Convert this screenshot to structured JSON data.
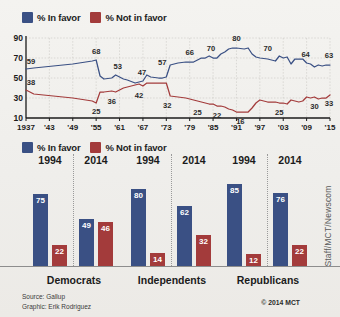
{
  "colors": {
    "in_favor": "#3a5084",
    "not_in_favor": "#a33b3b",
    "background": "#f2f1ee",
    "axis": "#1b1b1b",
    "grid": "#c9c7c2"
  },
  "clipped_title": "",
  "legend": {
    "in_favor_label": "% In favor",
    "not_in_favor_label": "% Not in favor"
  },
  "source": {
    "line1": "Source: Gallup",
    "line2": "Graphic: Erik Rodriguez"
  },
  "copyright": "© 2014 MCT",
  "credit": "Staff/MCT/Newscom",
  "chart_data": [
    {
      "type": "line",
      "title": "",
      "xlabel": "",
      "ylabel": "",
      "ylim": [
        10,
        90
      ],
      "yticks": [
        90,
        70,
        50,
        30,
        10
      ],
      "xticks": [
        "1937",
        "'43",
        "'49",
        "'55",
        "'61",
        "'67",
        "'73",
        "'79",
        "'85",
        "'91",
        "'97",
        "'03",
        "'09",
        "'15"
      ],
      "grid": true,
      "legend_position": "top-left",
      "series": [
        {
          "name": "% In favor",
          "color": "#3a5084",
          "x": [
            1937,
            1939,
            1944,
            1949,
            1954,
            1955,
            1956,
            1957,
            1959,
            1960,
            1962,
            1963,
            1965,
            1966,
            1967,
            1968,
            1969,
            1971,
            1972,
            1973,
            1974,
            1976,
            1978,
            1980,
            1981,
            1982,
            1983,
            1984,
            1985,
            1986,
            1987,
            1988,
            1989,
            1990,
            1991,
            1993,
            1994,
            1995,
            1996,
            1997,
            1999,
            2001,
            2002,
            2003,
            2004,
            2005,
            2006,
            2007,
            2008,
            2009,
            2010,
            2011,
            2012,
            2013,
            2014,
            2015
          ],
          "y": [
            59,
            60,
            62,
            64,
            67,
            68,
            52,
            49,
            50,
            53,
            49,
            48,
            45,
            46,
            47,
            53,
            51,
            50,
            50,
            51,
            63,
            65,
            66,
            66,
            68,
            70,
            70,
            72,
            70,
            70,
            74,
            76,
            79,
            80,
            80,
            79,
            80,
            74,
            71,
            70,
            69,
            67,
            72,
            70,
            71,
            64,
            69,
            69,
            69,
            65,
            64,
            61,
            63,
            62,
            63,
            63
          ]
        },
        {
          "name": "% Not in favor",
          "color": "#a33b3b",
          "x": [
            1937,
            1939,
            1944,
            1949,
            1954,
            1955,
            1956,
            1957,
            1959,
            1960,
            1962,
            1963,
            1965,
            1966,
            1967,
            1968,
            1969,
            1971,
            1972,
            1973,
            1974,
            1976,
            1978,
            1980,
            1981,
            1982,
            1983,
            1984,
            1985,
            1986,
            1987,
            1988,
            1989,
            1990,
            1991,
            1993,
            1994,
            1995,
            1996,
            1997,
            1999,
            2001,
            2002,
            2003,
            2004,
            2005,
            2006,
            2007,
            2008,
            2009,
            2010,
            2011,
            2012,
            2013,
            2014,
            2015
          ],
          "y": [
            38,
            34,
            32,
            30,
            27,
            25,
            36,
            36,
            37,
            36,
            40,
            41,
            43,
            44,
            42,
            45,
            45,
            45,
            45,
            45,
            32,
            31,
            30,
            28,
            27,
            26,
            25,
            24,
            24,
            22,
            22,
            21,
            19,
            18,
            16,
            16,
            16,
            20,
            25,
            28,
            26,
            26,
            25,
            25,
            24,
            28,
            27,
            26,
            27,
            31,
            30,
            31,
            29,
            30,
            30,
            33
          ]
        }
      ],
      "annotations": [
        {
          "x": 1937,
          "value": 59,
          "series": "in_favor"
        },
        {
          "x": 1955,
          "value": 68,
          "series": "in_favor"
        },
        {
          "x": 1960,
          "value": 53,
          "series": "in_favor"
        },
        {
          "x": 1967,
          "value": 47,
          "series": "in_favor"
        },
        {
          "x": 1973,
          "value": 57,
          "series": "in_favor"
        },
        {
          "x": 1979,
          "value": 66,
          "series": "in_favor"
        },
        {
          "x": 1985,
          "value": 70,
          "series": "in_favor"
        },
        {
          "x": 1991,
          "value": 80,
          "series": "in_favor"
        },
        {
          "x": 1999,
          "value": 70,
          "series": "in_favor"
        },
        {
          "x": 2009,
          "value": 64,
          "series": "in_favor"
        },
        {
          "x": 2015,
          "value": 63,
          "series": "in_favor"
        },
        {
          "x": 1937,
          "value": 38,
          "series": "not_in_favor"
        },
        {
          "x": 1955,
          "value": 25,
          "series": "not_in_favor"
        },
        {
          "x": 1960,
          "value": 36,
          "series": "not_in_favor"
        },
        {
          "x": 1967,
          "value": 42,
          "series": "not_in_favor"
        },
        {
          "x": 1974,
          "value": 32,
          "series": "not_in_favor"
        },
        {
          "x": 1981,
          "value": 25,
          "series": "not_in_favor"
        },
        {
          "x": 1986,
          "value": 22,
          "series": "not_in_favor"
        },
        {
          "x": 1992,
          "value": 16,
          "series": "not_in_favor"
        },
        {
          "x": 2002,
          "value": 25,
          "series": "not_in_favor"
        },
        {
          "x": 2011,
          "value": 30,
          "series": "not_in_favor"
        },
        {
          "x": 2015,
          "value": 33,
          "series": "not_in_favor"
        }
      ]
    },
    {
      "type": "bar",
      "title": "",
      "ylim": [
        0,
        100
      ],
      "categories": [
        "Democrats",
        "Independents",
        "Republicans"
      ],
      "year_labels": [
        "1994",
        "2014"
      ],
      "groups": [
        {
          "label": "Democrats",
          "years": [
            {
              "year": "1994",
              "in_favor": 75,
              "not_in_favor": 22
            },
            {
              "year": "2014",
              "in_favor": 49,
              "not_in_favor": 46
            }
          ]
        },
        {
          "label": "Independents",
          "years": [
            {
              "year": "1994",
              "in_favor": 80,
              "not_in_favor": 14
            },
            {
              "year": "2014",
              "in_favor": 62,
              "not_in_favor": 32
            }
          ]
        },
        {
          "label": "Republicans",
          "years": [
            {
              "year": "1994",
              "in_favor": 85,
              "not_in_favor": 12
            },
            {
              "year": "2014",
              "in_favor": 76,
              "not_in_favor": 22
            }
          ]
        }
      ]
    }
  ]
}
